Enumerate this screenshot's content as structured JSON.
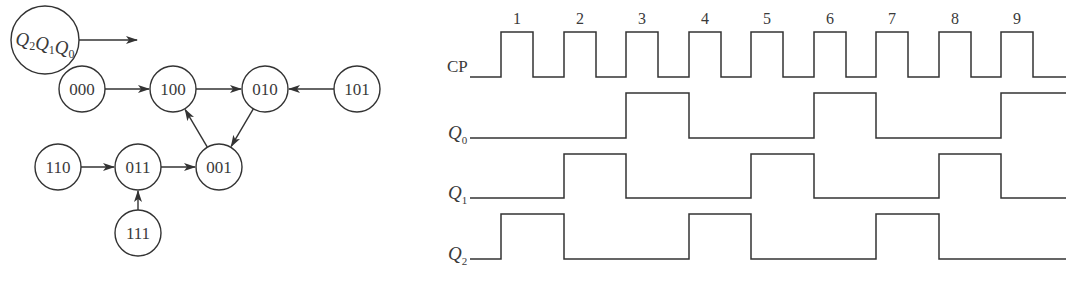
{
  "state_diagram": {
    "legend": {
      "label_parts": [
        [
          "Q",
          "2"
        ],
        [
          "Q",
          "1"
        ],
        [
          "Q",
          "0"
        ]
      ],
      "cx": 45,
      "cy": 40,
      "r": 34
    },
    "nodes": [
      {
        "id": "000",
        "label": "000",
        "cx": 82,
        "cy": 89
      },
      {
        "id": "100",
        "label": "100",
        "cx": 173,
        "cy": 89
      },
      {
        "id": "010",
        "label": "010",
        "cx": 265,
        "cy": 89
      },
      {
        "id": "101",
        "label": "101",
        "cx": 357,
        "cy": 89
      },
      {
        "id": "110",
        "label": "110",
        "cx": 58,
        "cy": 167
      },
      {
        "id": "011",
        "label": "011",
        "cx": 138,
        "cy": 167
      },
      {
        "id": "001",
        "label": "001",
        "cx": 219,
        "cy": 167
      },
      {
        "id": "111",
        "label": "111",
        "cx": 138,
        "cy": 233
      }
    ],
    "node_radius": 23,
    "edges": [
      {
        "from": "000",
        "to": "100"
      },
      {
        "from": "100",
        "to": "010"
      },
      {
        "from": "101",
        "to": "010"
      },
      {
        "from": "010",
        "to": "001"
      },
      {
        "from": "001",
        "to": "100"
      },
      {
        "from": "110",
        "to": "011"
      },
      {
        "from": "011",
        "to": "001"
      },
      {
        "from": "111",
        "to": "011"
      }
    ]
  },
  "timing_diagram": {
    "x_start": 470,
    "x_end": 1066,
    "clock_numbers": [
      "1",
      "2",
      "3",
      "4",
      "5",
      "6",
      "7",
      "8",
      "9"
    ],
    "signals": [
      {
        "name": "CP",
        "sub": "",
        "label_y": 77,
        "high_y": 32,
        "low_y": 77,
        "edges": [
          501,
          533,
          564,
          596,
          626,
          658,
          689,
          721,
          751,
          783,
          814,
          846,
          876,
          908,
          939,
          971,
          1001,
          1033
        ],
        "initial": 0
      },
      {
        "name": "Q",
        "sub": "0",
        "label_y": 138,
        "high_y": 93,
        "low_y": 138,
        "edges": [
          626,
          689,
          814,
          876,
          1001
        ],
        "initial": 0
      },
      {
        "name": "Q",
        "sub": "1",
        "label_y": 198,
        "high_y": 154,
        "low_y": 198,
        "edges": [
          564,
          626,
          751,
          814,
          939,
          1001
        ],
        "initial": 0
      },
      {
        "name": "Q",
        "sub": "2",
        "label_y": 259,
        "high_y": 214,
        "low_y": 259,
        "edges": [
          501,
          564,
          689,
          751,
          876,
          939
        ],
        "initial": 0
      }
    ]
  },
  "colors": {
    "line": "#333333",
    "text": "#3a3a3a",
    "background": "#ffffff"
  }
}
